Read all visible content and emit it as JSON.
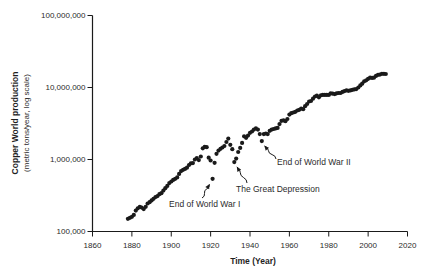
{
  "figure": {
    "background_color": "#ffffff",
    "dot_color": "#1a1a1a",
    "axis_color": "#1a1a1a",
    "text_color": "#2b2b2b",
    "y_axis_title_bold": "Copper World production",
    "y_axis_title_sub": "(metric tons/year, log scale)",
    "x_axis_title": "Time (Year)"
  },
  "chart_data": {
    "type": "scatter",
    "title": "",
    "xlabel": "Time (Year)",
    "ylabel": "Copper World production (metric tons/year, log scale)",
    "legend": "none",
    "grid": false,
    "x_axis": {
      "min": 1860,
      "max": 2020,
      "ticks": [
        1860,
        1880,
        1900,
        1920,
        1940,
        1960,
        1980,
        2000,
        2020
      ]
    },
    "y_axis": {
      "scale": "log",
      "min": 100000,
      "max": 100000000,
      "ticks": [
        {
          "value": 100000000,
          "label": "100,000,000"
        },
        {
          "value": 10000000,
          "label": "10,000,000"
        },
        {
          "value": 1000000,
          "label": "1,000,000"
        },
        {
          "value": 100000,
          "label": "100,000"
        }
      ]
    },
    "series": [
      {
        "name": "World copper production (metric tons/year)",
        "x_start": 1878,
        "x_step": 1,
        "values": [
          150000,
          155000,
          160000,
          170000,
          195000,
          210000,
          220000,
          215000,
          205000,
          220000,
          245000,
          255000,
          270000,
          285000,
          300000,
          310000,
          330000,
          340000,
          370000,
          400000,
          430000,
          470000,
          495000,
          520000,
          540000,
          565000,
          630000,
          690000,
          720000,
          740000,
          770000,
          840000,
          885000,
          890000,
          1000000,
          1050000,
          980000,
          1100000,
          1430000,
          1500000,
          1480000,
          1060000,
          970000,
          540000,
          900000,
          1200000,
          1330000,
          1410000,
          1470000,
          1540000,
          1750000,
          1950000,
          1600000,
          1390000,
          920000,
          1030000,
          1270000,
          1450000,
          1700000,
          2100000,
          2000000,
          2150000,
          2350000,
          2450000,
          2600000,
          2700000,
          2600000,
          2250000,
          1800000,
          2250000,
          2300000,
          2250000,
          2500000,
          2600000,
          2650000,
          2700000,
          2750000,
          3100000,
          3450000,
          3500000,
          3400000,
          3650000,
          4200000,
          4400000,
          4500000,
          4600000,
          4800000,
          4900000,
          5100000,
          5000000,
          5500000,
          5900000,
          6400000,
          6500000,
          7000000,
          7500000,
          7700000,
          7300000,
          7800000,
          7900000,
          7900000,
          7900000,
          7900000,
          8300000,
          8200000,
          8100000,
          8300000,
          8400000,
          8400000,
          8700000,
          8900000,
          9100000,
          9000000,
          9100000,
          9300000,
          9400000,
          9500000,
          10000000,
          10700000,
          11300000,
          12200000,
          12600000,
          13200000,
          13700000,
          13600000,
          13700000,
          14500000,
          15000000,
          15100000,
          15500000,
          15500000,
          15400000
        ]
      }
    ],
    "annotations": [
      {
        "label": "End of World War I",
        "points_to": {
          "year": 1921,
          "value": 540000
        }
      },
      {
        "label": "The Great Depression",
        "points_to": {
          "year": 1932,
          "value": 920000
        }
      },
      {
        "label": "End of World War II",
        "points_to": {
          "year": 1946,
          "value": 1800000
        }
      }
    ]
  }
}
